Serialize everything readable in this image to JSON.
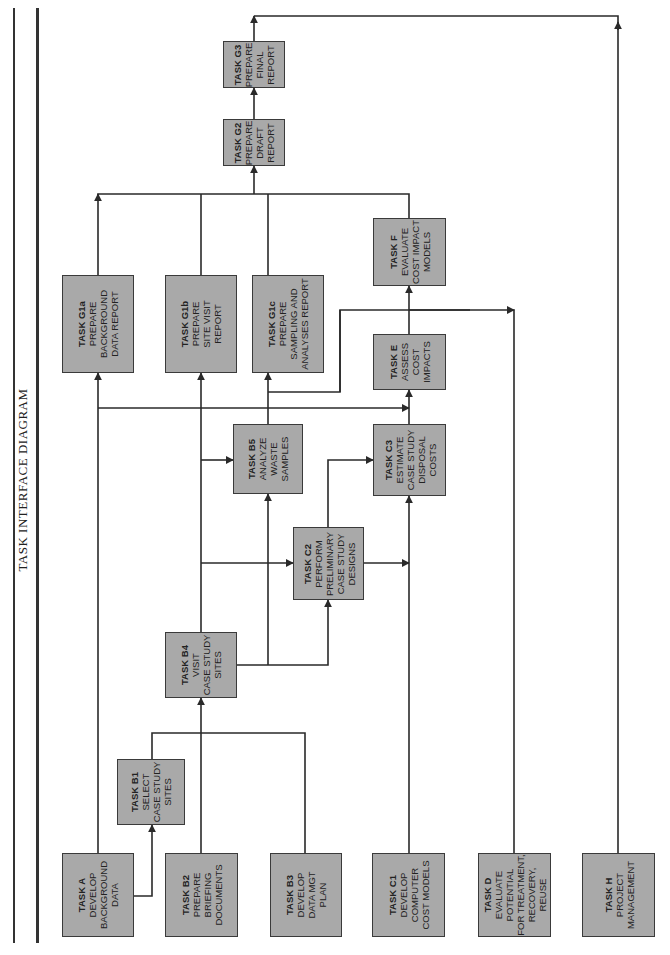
{
  "title": "TASK INTERFACE DIAGRAM",
  "colors": {
    "box_fill": "#a9a9a9",
    "box_border": "#3a3a3a",
    "line": "#2a2a2a"
  },
  "tasks": {
    "A": {
      "id": "TASK A",
      "lines": [
        "DEVELOP",
        "BACKGROUND",
        "DATA"
      ]
    },
    "B1": {
      "id": "TASK B1",
      "lines": [
        "SELECT",
        "CASE STUDY",
        "SITES"
      ]
    },
    "B2": {
      "id": "TASK B2",
      "lines": [
        "PREPARE",
        "BRIEFING",
        "DOCUMENTS"
      ]
    },
    "B3": {
      "id": "TASK B3",
      "lines": [
        "DEVELOP",
        "DATA MGT",
        "PLAN"
      ]
    },
    "B4": {
      "id": "TASK B4",
      "lines": [
        "VISIT",
        "CASE STUDY",
        "SITES"
      ]
    },
    "B5": {
      "id": "TASK B5",
      "lines": [
        "ANALYZE",
        "WASTE",
        "SAMPLES"
      ]
    },
    "C1": {
      "id": "TASK C1",
      "lines": [
        "DEVELOP",
        "COMPUTER",
        "COST MODELS"
      ]
    },
    "C2": {
      "id": "TASK C2",
      "lines": [
        "PERFORM",
        "PRELIMINARY",
        "CASE STUDY",
        "DESIGNS"
      ]
    },
    "C3": {
      "id": "TASK C3",
      "lines": [
        "ESTIMATE",
        "CASE STUDY",
        "DISPOSAL",
        "COSTS"
      ]
    },
    "D": {
      "id": "TASK D",
      "lines": [
        "EVALUATE",
        "POTENTIAL",
        "FOR TREATMENT,",
        "RECOVERY,",
        "REUSE"
      ]
    },
    "E": {
      "id": "TASK E",
      "lines": [
        "ASSESS",
        "COST",
        "IMPACTS"
      ]
    },
    "F": {
      "id": "TASK F",
      "lines": [
        "EVALUATE",
        "COST IMPACT",
        "MODELS"
      ]
    },
    "G1a": {
      "id": "TASK G1a",
      "lines": [
        "PREPARE",
        "BACKGROUND",
        "DATA REPORT"
      ]
    },
    "G1b": {
      "id": "TASK G1b",
      "lines": [
        "PREPARE",
        "SITE VISIT",
        "REPORT"
      ]
    },
    "G1c": {
      "id": "TASK G1c",
      "lines": [
        "PREPARE",
        "SAMPLING AND",
        "ANALYSES REPORT"
      ]
    },
    "G2": {
      "id": "TASK G2",
      "lines": [
        "PREPARE",
        "DRAFT",
        "REPORT"
      ]
    },
    "G3": {
      "id": "TASK G3",
      "lines": [
        "PREPARE",
        "FINAL",
        "REPORT"
      ]
    },
    "H": {
      "id": "TASK H",
      "lines": [
        "PROJECT",
        "MANAGEMENT"
      ]
    }
  },
  "connections": [
    [
      "A",
      "B1"
    ],
    [
      "A",
      "G1a"
    ],
    [
      "B1",
      "B4"
    ],
    [
      "B2",
      "B4"
    ],
    [
      "B3",
      "B4"
    ],
    [
      "B4",
      "B5"
    ],
    [
      "B4",
      "C2"
    ],
    [
      "B4",
      "G1b"
    ],
    [
      "C2",
      "C3"
    ],
    [
      "C2",
      "B5"
    ],
    [
      "B5",
      "G1c"
    ],
    [
      "B5",
      "E"
    ],
    [
      "C1",
      "C3"
    ],
    [
      "C3",
      "E"
    ],
    [
      "E",
      "F"
    ],
    [
      "D",
      "F"
    ],
    [
      "G1a",
      "G2"
    ],
    [
      "G1b",
      "G2"
    ],
    [
      "G1c",
      "G2"
    ],
    [
      "F",
      "G2"
    ],
    [
      "G2",
      "G3"
    ],
    [
      "H",
      "G3"
    ]
  ]
}
